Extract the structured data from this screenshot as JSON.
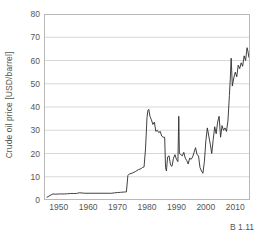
{
  "figure": {
    "corner_note": "B 1.11",
    "background_color": "#ffffff",
    "frame_color": "#b8b8b8",
    "grid_color": "#d8d8d8",
    "line_color": "#2b2b2b",
    "tick_text_color": "#555555"
  },
  "chart_data": {
    "type": "line",
    "title": "",
    "xlabel": "",
    "ylabel": "Crude oil price [USD/barrel]",
    "xlim": [
      1945,
      2015
    ],
    "ylim": [
      0,
      80
    ],
    "grid": "horizontal",
    "legend_position": "none",
    "yticks": [
      0,
      10,
      20,
      30,
      40,
      50,
      60,
      70,
      80
    ],
    "ytick_labels": [
      "0",
      "10",
      "20",
      "30",
      "40",
      "50",
      "60",
      "70",
      "80"
    ],
    "xticks": [
      1950,
      1960,
      1970,
      1980,
      1990,
      2000,
      2010
    ],
    "xtick_labels": [
      "1950",
      "1960",
      "1970",
      "1980",
      "1990",
      "2000",
      "2010"
    ],
    "xminor_ticks": [
      1945,
      1955,
      1965,
      1975,
      1985,
      1995,
      2005,
      2015
    ],
    "series": [
      {
        "name": "Crude oil price",
        "x": [
          1946,
          1947,
          1948,
          1949,
          1950,
          1951,
          1952,
          1953,
          1954,
          1955,
          1956,
          1957,
          1958,
          1959,
          1960,
          1961,
          1962,
          1963,
          1964,
          1965,
          1966,
          1967,
          1968,
          1969,
          1970,
          1971,
          1972,
          1973,
          1973.5,
          1974,
          1975,
          1976,
          1977,
          1978,
          1978.5,
          1979,
          1979.5,
          1980,
          1980.3,
          1980.6,
          1981,
          1981.5,
          1982,
          1982.5,
          1983,
          1983.5,
          1984,
          1984.5,
          1985,
          1985.5,
          1986,
          1986.3,
          1986.6,
          1987,
          1987.5,
          1988,
          1988.5,
          1989,
          1989.5,
          1990,
          1990.5,
          1990.8,
          1991,
          1991.5,
          1992,
          1992.5,
          1993,
          1993.5,
          1994,
          1994.5,
          1995,
          1995.5,
          1996,
          1996.5,
          1997,
          1997.5,
          1998,
          1998.5,
          1999,
          1999.5,
          2000,
          2000.5,
          2001,
          2001.5,
          2002,
          2002.5,
          2003,
          2003.5,
          2004,
          2004.5,
          2005,
          2005.5,
          2006,
          2006.5,
          2007,
          2007.5,
          2008,
          2008.3,
          2008.6,
          2009,
          2009.5,
          2010,
          2010.5,
          2011,
          2011.5,
          2012,
          2012.5,
          2013,
          2013.5,
          2014,
          2014.3,
          2014.6,
          2015
        ],
        "y": [
          1.2,
          1.9,
          2.6,
          2.5,
          2.6,
          2.6,
          2.6,
          2.7,
          2.8,
          2.8,
          2.8,
          3.1,
          3.0,
          2.9,
          2.9,
          2.9,
          2.9,
          2.9,
          2.9,
          2.9,
          2.9,
          2.9,
          2.9,
          3.1,
          3.2,
          3.3,
          3.4,
          3.5,
          10.5,
          11.2,
          11.6,
          12.2,
          13.0,
          13.5,
          14.0,
          14.2,
          22.0,
          35.5,
          38.5,
          39.0,
          36.0,
          34.5,
          32.5,
          33.5,
          29.5,
          30.0,
          29.0,
          29.5,
          27.5,
          27.0,
          27.0,
          14.0,
          12.5,
          18.5,
          19.0,
          15.0,
          14.5,
          18.0,
          19.5,
          17.5,
          16.5,
          36.0,
          20.0,
          19.5,
          19.0,
          20.5,
          18.0,
          17.0,
          15.5,
          18.0,
          17.5,
          18.5,
          20.5,
          22.5,
          19.5,
          19.0,
          14.0,
          12.5,
          11.5,
          16.5,
          25.5,
          31.0,
          27.5,
          24.0,
          20.0,
          26.0,
          31.5,
          28.5,
          33.5,
          36.0,
          27.0,
          32.0,
          30.0,
          31.0,
          29.5,
          34.0,
          45.0,
          52.0,
          61.0,
          49.0,
          52.5,
          55.0,
          53.0,
          58.0,
          56.5,
          59.0,
          57.5,
          62.0,
          60.0,
          65.5,
          64.0,
          61.5,
          60.5
        ]
      }
    ]
  }
}
